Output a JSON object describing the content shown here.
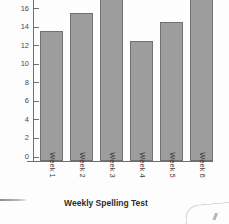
{
  "chart_data": {
    "type": "bar",
    "title": "Weekly Spelling Test",
    "xlabel": "",
    "ylabel": "",
    "categories": [
      "Week 1",
      "Week 2",
      "Week 3",
      "Week 4",
      "Week 5",
      "Week 6"
    ],
    "values": [
      14,
      16,
      19,
      13,
      15,
      19
    ],
    "ylim": [
      0,
      19
    ],
    "yticks": [
      0,
      2,
      4,
      6,
      8,
      10,
      12,
      14,
      16,
      18
    ],
    "ytick_labels": [
      "0",
      "2",
      "4",
      "6",
      "8",
      "10",
      "12",
      "14",
      "16",
      "18"
    ],
    "grid": false,
    "legend": null,
    "bar_color": "#9d9d9d",
    "bar_border_color": "#717171",
    "axis_color": "#6f6f6f"
  },
  "artifacts": {
    "corner_mark": "//"
  }
}
